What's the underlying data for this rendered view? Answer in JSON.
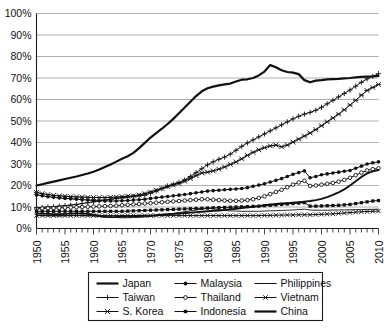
{
  "chart_data": {
    "type": "line",
    "title": "",
    "xlabel": "",
    "ylabel": "",
    "xlim": [
      1950,
      2010
    ],
    "ylim": [
      0,
      100
    ],
    "grid": true,
    "legend_position": "bottom",
    "y_ticks": [
      "0%",
      "10%",
      "20%",
      "30%",
      "40%",
      "50%",
      "60%",
      "70%",
      "80%",
      "90%",
      "100%"
    ],
    "y_tick_values": [
      0,
      10,
      20,
      30,
      40,
      50,
      60,
      70,
      80,
      90,
      100
    ],
    "x_ticks": [
      "1950",
      "1955",
      "1960",
      "1965",
      "1970",
      "1975",
      "1980",
      "1985",
      "1990",
      "1995",
      "2000",
      "2005",
      "2010"
    ],
    "x_tick_values": [
      1950,
      1955,
      1960,
      1965,
      1970,
      1975,
      1980,
      1985,
      1990,
      1995,
      2000,
      2005,
      2010
    ],
    "x": [
      1950,
      1951,
      1952,
      1953,
      1954,
      1955,
      1956,
      1957,
      1958,
      1959,
      1960,
      1961,
      1962,
      1963,
      1964,
      1965,
      1966,
      1967,
      1968,
      1969,
      1970,
      1971,
      1972,
      1973,
      1974,
      1975,
      1976,
      1977,
      1978,
      1979,
      1980,
      1981,
      1982,
      1983,
      1984,
      1985,
      1986,
      1987,
      1988,
      1989,
      1990,
      1991,
      1992,
      1993,
      1994,
      1995,
      1996,
      1997,
      1998,
      1999,
      2000,
      2001,
      2002,
      2003,
      2004,
      2005,
      2006,
      2007,
      2008,
      2009,
      2010
    ],
    "series": [
      {
        "name": "Japan",
        "marker": "none",
        "line_width": 2.2,
        "values": [
          20.0,
          20.6,
          21.2,
          21.8,
          22.4,
          23.0,
          23.6,
          24.2,
          24.9,
          25.6,
          26.4,
          27.4,
          28.6,
          29.8,
          31.1,
          32.4,
          33.6,
          35.2,
          37.4,
          39.8,
          42.3,
          44.4,
          46.4,
          48.6,
          51.0,
          53.6,
          56.3,
          59.0,
          61.6,
          63.8,
          65.2,
          66.0,
          66.6,
          67.0,
          67.4,
          68.4,
          69.2,
          69.4,
          70.0,
          71.2,
          73.0,
          76.0,
          75.0,
          73.6,
          72.8,
          72.5,
          71.8,
          69.0,
          68.0,
          68.8,
          69.0,
          69.4,
          69.5,
          69.6,
          69.8,
          70.0,
          70.3,
          70.5,
          70.6,
          70.7,
          71.0
        ]
      },
      {
        "name": "Taiwan",
        "marker": "plus",
        "line_width": 1.0,
        "values": [
          9.7,
          9.8,
          10.0,
          10.2,
          10.4,
          10.6,
          10.9,
          11.2,
          11.6,
          12.0,
          12.4,
          12.8,
          13.2,
          13.6,
          14.0,
          14.3,
          14.6,
          14.9,
          15.2,
          15.6,
          16.4,
          17.4,
          18.6,
          19.8,
          20.6,
          21.4,
          22.6,
          24.2,
          26.0,
          27.8,
          29.6,
          31.0,
          32.2,
          33.2,
          34.6,
          36.4,
          38.2,
          39.8,
          41.2,
          42.6,
          44.0,
          45.4,
          46.8,
          48.2,
          49.6,
          51.0,
          52.2,
          53.2,
          54.0,
          55.0,
          56.4,
          58.0,
          59.6,
          61.2,
          62.8,
          64.4,
          66.2,
          68.0,
          69.6,
          70.8,
          72.0
        ]
      },
      {
        "name": "S. Korea",
        "marker": "asterisk",
        "line_width": 1.0,
        "values": [
          16.8,
          16.2,
          15.8,
          15.4,
          15.2,
          15.0,
          14.8,
          14.7,
          14.6,
          14.5,
          14.4,
          14.4,
          14.4,
          14.5,
          14.6,
          14.8,
          15.0,
          15.2,
          15.6,
          16.2,
          17.0,
          17.8,
          18.6,
          19.4,
          20.2,
          21.0,
          22.0,
          23.2,
          24.6,
          25.8,
          26.2,
          26.8,
          27.6,
          28.6,
          29.8,
          31.0,
          32.4,
          34.0,
          35.4,
          36.6,
          37.6,
          38.4,
          38.8,
          38.0,
          38.8,
          40.2,
          41.6,
          43.0,
          44.4,
          46.0,
          47.8,
          49.6,
          51.4,
          53.2,
          55.2,
          57.4,
          59.6,
          62.0,
          64.2,
          65.6,
          67.0
        ]
      },
      {
        "name": "Malaysia",
        "marker": "circle-filled",
        "line_width": 1.0,
        "values": [
          15.6,
          15.2,
          14.8,
          14.5,
          14.2,
          14.0,
          13.8,
          13.6,
          13.4,
          13.2,
          13.0,
          12.9,
          12.8,
          12.8,
          12.8,
          12.9,
          13.0,
          13.2,
          13.4,
          13.6,
          14.0,
          14.3,
          14.6,
          14.9,
          15.2,
          15.5,
          15.8,
          16.2,
          16.6,
          17.0,
          17.4,
          17.6,
          17.8,
          18.0,
          18.2,
          18.4,
          18.6,
          19.0,
          19.6,
          20.2,
          20.8,
          21.6,
          22.4,
          23.2,
          24.2,
          25.2,
          26.0,
          26.8,
          23.6,
          24.2,
          25.0,
          25.4,
          25.8,
          26.2,
          26.6,
          27.0,
          28.0,
          29.0,
          30.0,
          30.6,
          31.0
        ]
      },
      {
        "name": "Thailand",
        "marker": "circle-open",
        "line_width": 1.0,
        "values": [
          9.2,
          9.3,
          9.4,
          9.5,
          9.6,
          9.7,
          9.8,
          9.9,
          10.0,
          10.1,
          10.2,
          10.3,
          10.4,
          10.5,
          10.6,
          10.8,
          11.0,
          11.2,
          11.4,
          11.6,
          11.8,
          12.0,
          12.2,
          12.4,
          12.6,
          12.8,
          13.0,
          13.2,
          13.4,
          13.6,
          13.6,
          13.4,
          13.2,
          13.0,
          12.9,
          12.9,
          13.0,
          13.2,
          13.6,
          14.2,
          15.0,
          16.0,
          17.0,
          18.0,
          19.2,
          20.4,
          21.4,
          22.2,
          19.8,
          20.0,
          20.4,
          20.8,
          21.2,
          21.8,
          22.6,
          23.6,
          24.8,
          26.0,
          27.0,
          27.6,
          28.0
        ]
      },
      {
        "name": "Indonesia",
        "marker": "square-filled",
        "line_width": 1.0,
        "values": [
          8.0,
          8.0,
          8.0,
          8.0,
          8.0,
          8.0,
          8.0,
          8.0,
          8.0,
          8.0,
          8.0,
          8.0,
          8.0,
          8.0,
          8.0,
          8.0,
          8.1,
          8.2,
          8.3,
          8.4,
          8.5,
          8.6,
          8.7,
          8.8,
          8.9,
          9.0,
          9.1,
          9.2,
          9.3,
          9.4,
          9.5,
          9.6,
          9.7,
          9.8,
          9.9,
          10.0,
          10.1,
          10.2,
          10.3,
          10.4,
          10.6,
          10.8,
          11.0,
          11.2,
          11.4,
          11.6,
          11.8,
          12.0,
          10.4,
          10.4,
          10.5,
          10.6,
          10.7,
          10.8,
          11.0,
          11.2,
          11.6,
          12.0,
          12.4,
          12.8,
          13.0
        ]
      },
      {
        "name": "Philippines",
        "marker": "none",
        "line_width": 0.9,
        "values": [
          6.2,
          6.0,
          5.9,
          5.8,
          5.8,
          5.9,
          6.0,
          6.0,
          6.0,
          5.9,
          5.8,
          5.6,
          5.4,
          5.2,
          5.1,
          5.0,
          5.0,
          5.1,
          5.2,
          5.4,
          5.6,
          5.9,
          6.2,
          6.6,
          7.0,
          7.4,
          7.8,
          8.2,
          8.6,
          9.0,
          9.4,
          9.2,
          8.8,
          8.4,
          8.2,
          8.1,
          8.0,
          8.0,
          8.0,
          8.0,
          8.1,
          8.2,
          8.3,
          8.4,
          8.5,
          8.6,
          8.8,
          9.0,
          8.6,
          8.5,
          8.5,
          8.5,
          8.6,
          8.6,
          8.7,
          8.7,
          8.8,
          8.8,
          8.9,
          8.9,
          9.0
        ]
      },
      {
        "name": "Vietnam",
        "marker": "x-cross",
        "line_width": 1.0,
        "values": [
          6.0,
          6.0,
          6.0,
          6.0,
          6.0,
          6.0,
          6.0,
          6.0,
          6.0,
          6.0,
          6.0,
          6.0,
          6.0,
          6.0,
          6.0,
          6.0,
          6.0,
          6.0,
          6.0,
          6.0,
          6.0,
          6.0,
          6.0,
          6.0,
          6.0,
          6.0,
          6.0,
          6.0,
          6.0,
          6.0,
          6.0,
          6.0,
          6.0,
          6.0,
          6.0,
          6.0,
          6.0,
          6.0,
          6.0,
          6.0,
          6.1,
          6.1,
          6.2,
          6.2,
          6.3,
          6.3,
          6.4,
          6.4,
          6.4,
          6.5,
          6.6,
          6.7,
          6.8,
          7.0,
          7.2,
          7.4,
          7.6,
          7.8,
          7.9,
          8.0,
          8.1
        ]
      },
      {
        "name": "China",
        "marker": "none",
        "line_width": 1.9,
        "values": [
          7.0,
          6.9,
          6.8,
          6.7,
          6.7,
          6.8,
          6.9,
          7.0,
          7.0,
          6.8,
          6.4,
          5.8,
          5.4,
          5.3,
          5.4,
          5.6,
          5.7,
          5.8,
          5.8,
          5.9,
          6.0,
          6.2,
          6.4,
          6.6,
          6.8,
          7.0,
          7.2,
          7.4,
          7.6,
          7.8,
          8.0,
          8.2,
          8.4,
          8.6,
          8.9,
          9.2,
          9.5,
          9.8,
          10.1,
          10.4,
          10.8,
          11.1,
          11.4,
          11.6,
          11.8,
          12.0,
          12.2,
          12.5,
          12.8,
          13.2,
          13.8,
          14.6,
          15.6,
          16.8,
          18.2,
          20.0,
          22.0,
          24.0,
          25.6,
          26.6,
          27.2
        ]
      }
    ]
  },
  "legend": {
    "columns": [
      [
        {
          "label": "Japan",
          "marker": "none",
          "width": "thick"
        },
        {
          "label": "Taiwan",
          "marker": "plus",
          "width": "thin"
        },
        {
          "label": "S. Korea",
          "marker": "asterisk",
          "width": "thin"
        }
      ],
      [
        {
          "label": "Malaysia",
          "marker": "circle-filled",
          "width": "thin"
        },
        {
          "label": "Thailand",
          "marker": "circle-open",
          "width": "thin"
        },
        {
          "label": "Indonesia",
          "marker": "square-filled",
          "width": "thin"
        }
      ],
      [
        {
          "label": "Philippines",
          "marker": "none",
          "width": "thin"
        },
        {
          "label": "Vietnam",
          "marker": "x-cross",
          "width": "thin"
        },
        {
          "label": "China",
          "marker": "none",
          "width": "thick"
        }
      ]
    ]
  },
  "colors": {
    "line": "#111111",
    "grid": "#9a9a9a",
    "axis": "#1a1a1a",
    "background": "#ffffff"
  }
}
